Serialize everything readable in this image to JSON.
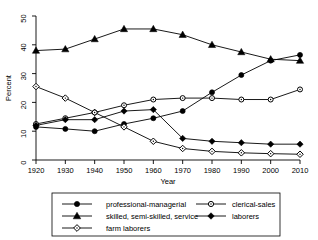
{
  "chart_data": {
    "type": "line",
    "title": "",
    "xlabel": "Year",
    "ylabel": "Percent",
    "xlim": [
      1920,
      2010
    ],
    "ylim": [
      0,
      50
    ],
    "grid": false,
    "legend_position": "bottom",
    "x": [
      1920,
      1930,
      1940,
      1950,
      1960,
      1970,
      1980,
      1990,
      2000,
      2010
    ],
    "xticks": [
      "1920",
      "1930",
      "1940",
      "1950",
      "1960",
      "1970",
      "1980",
      "1990",
      "2000",
      "2010"
    ],
    "yticks": [
      "0",
      "10",
      "20",
      "30",
      "40",
      "50"
    ],
    "series": [
      {
        "name": "professional-managerial",
        "marker": "filled-circle",
        "values": [
          11.5,
          10.8,
          10.0,
          12.5,
          14.5,
          17.0,
          23.5,
          29.5,
          34.5,
          36.5
        ]
      },
      {
        "name": "skilled, semi-skilled, service",
        "marker": "filled-triangle",
        "values": [
          38.0,
          38.5,
          42.0,
          45.5,
          45.5,
          43.5,
          40.0,
          37.5,
          35.0,
          34.5
        ]
      },
      {
        "name": "farm laborers",
        "marker": "open-diamond",
        "values": [
          25.5,
          21.5,
          16.5,
          11.5,
          6.5,
          4.0,
          3.0,
          2.5,
          2.2,
          2.0
        ]
      },
      {
        "name": "clerical-sales",
        "marker": "open-circle",
        "values": [
          12.5,
          14.5,
          16.5,
          19.0,
          21.0,
          21.5,
          21.5,
          21.0,
          21.0,
          24.5
        ]
      },
      {
        "name": "laborers",
        "marker": "filled-diamond",
        "values": [
          12.0,
          14.0,
          14.0,
          17.0,
          17.5,
          7.5,
          6.5,
          6.0,
          5.5,
          5.5
        ]
      }
    ]
  },
  "legend": {
    "entries": [
      {
        "label": "professional-managerial",
        "marker": "filled-circle"
      },
      {
        "label": "clerical-sales",
        "marker": "open-circle"
      },
      {
        "label": "skilled, semi-skilled, service",
        "marker": "filled-triangle"
      },
      {
        "label": "laborers",
        "marker": "filled-diamond"
      },
      {
        "label": "farm laborers",
        "marker": "open-diamond"
      }
    ]
  },
  "colors": {
    "line": "#000000",
    "axis": "#000000",
    "background": "#ffffff"
  }
}
